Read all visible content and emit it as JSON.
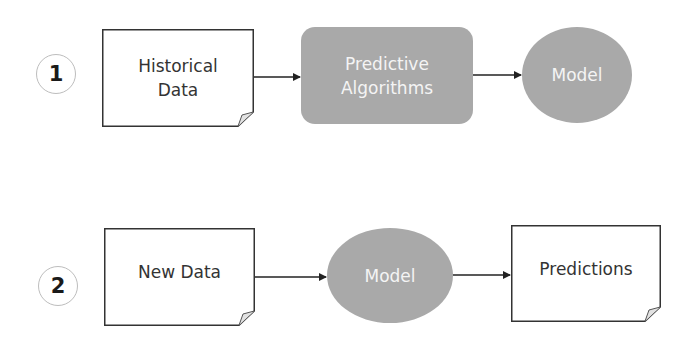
{
  "diagram": {
    "rows": [
      {
        "step": "1",
        "nodes": [
          {
            "label_lines": [
              "Historical",
              "Data"
            ],
            "shape": "document"
          },
          {
            "label_lines": [
              "Predictive",
              "Algorithms"
            ],
            "shape": "rounded-rectangle"
          },
          {
            "label": "Model",
            "shape": "ellipse"
          }
        ]
      },
      {
        "step": "2",
        "nodes": [
          {
            "label": "New Data",
            "shape": "document"
          },
          {
            "label": "Model",
            "shape": "ellipse"
          },
          {
            "label": "Predictions",
            "shape": "document"
          }
        ]
      }
    ],
    "colors": {
      "process_fill": "#a9a9a9",
      "process_text": "#f4f4f4",
      "document_border": "#333333",
      "arrow": "#222222"
    }
  }
}
